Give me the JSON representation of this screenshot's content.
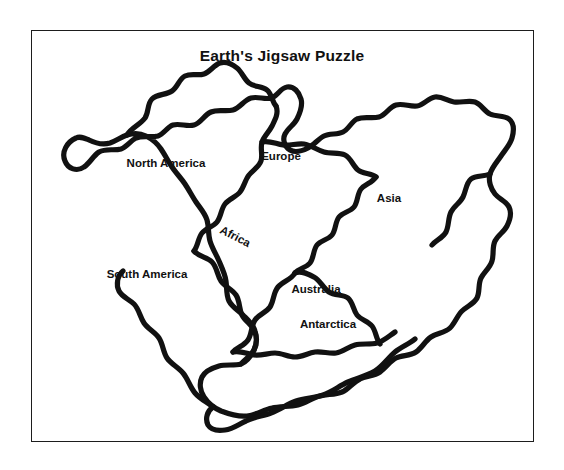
{
  "figure": {
    "title": "Earth's Jigsaw Puzzle",
    "frame_color": "#1d1d1d",
    "ink_color": "#111111",
    "background_color": "#ffffff"
  },
  "map": {
    "kind": "pangaea-supercontinent-outline",
    "labels": [
      {
        "id": "north-america",
        "text": "North America",
        "x": 166,
        "y": 164,
        "rotation": 0
      },
      {
        "id": "europe",
        "text": "Europe",
        "x": 281,
        "y": 157,
        "rotation": 0
      },
      {
        "id": "asia",
        "text": "Asia",
        "x": 389,
        "y": 199,
        "rotation": 0
      },
      {
        "id": "africa",
        "text": "Africa",
        "x": 235,
        "y": 237,
        "rotation": 27
      },
      {
        "id": "south-america",
        "text": "South America",
        "x": 147,
        "y": 275,
        "rotation": 0
      },
      {
        "id": "australia",
        "text": "Australia",
        "x": 316,
        "y": 290,
        "rotation": 0
      },
      {
        "id": "antarctica",
        "text": "Antarctica",
        "x": 328,
        "y": 325,
        "rotation": 0
      }
    ]
  }
}
